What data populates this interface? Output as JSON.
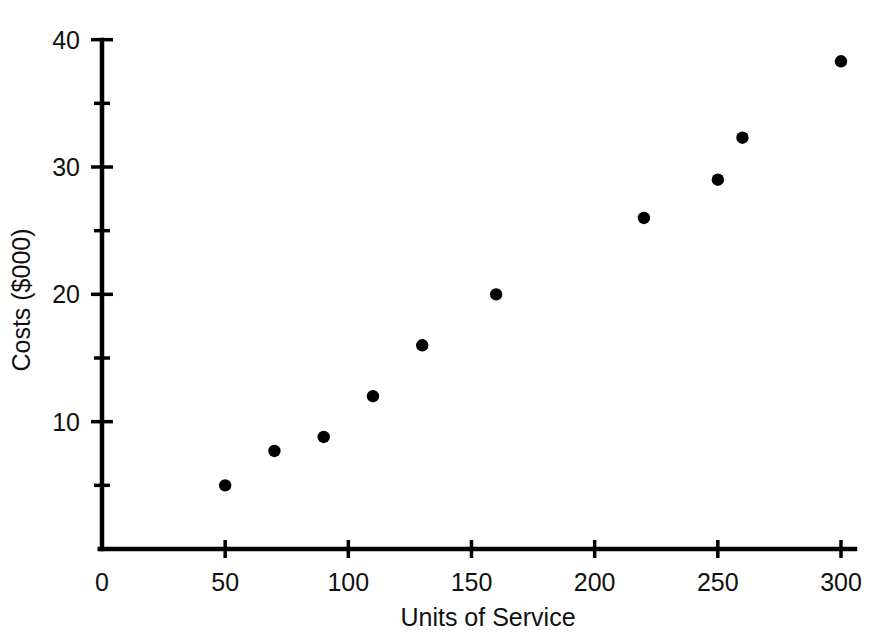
{
  "chart_data": {
    "type": "scatter",
    "title": "",
    "xlabel": "Units of Service",
    "ylabel": "Costs ($000)",
    "xlim": [
      0,
      305
    ],
    "ylim": [
      0,
      40
    ],
    "grid": false,
    "legend": null,
    "x_ticks_major": [
      0,
      50,
      100,
      150,
      200,
      250,
      300
    ],
    "x_tick_labels": [
      "0",
      "50",
      "100",
      "150",
      "200",
      "250",
      "300"
    ],
    "y_ticks_major": [
      10,
      20,
      30,
      40
    ],
    "y_tick_labels": [
      "10",
      "20",
      "30",
      "40"
    ],
    "y_ticks_minor": [
      5,
      15,
      25,
      35
    ],
    "marker_color": "#000000",
    "axis_color": "#000000",
    "points": [
      {
        "x": 50,
        "y": 5.0
      },
      {
        "x": 70,
        "y": 7.7
      },
      {
        "x": 90,
        "y": 8.8
      },
      {
        "x": 110,
        "y": 12.0
      },
      {
        "x": 130,
        "y": 16.0
      },
      {
        "x": 160,
        "y": 20.0
      },
      {
        "x": 220,
        "y": 26.0
      },
      {
        "x": 250,
        "y": 29.0
      },
      {
        "x": 260,
        "y": 32.3
      },
      {
        "x": 300,
        "y": 38.3
      }
    ]
  }
}
